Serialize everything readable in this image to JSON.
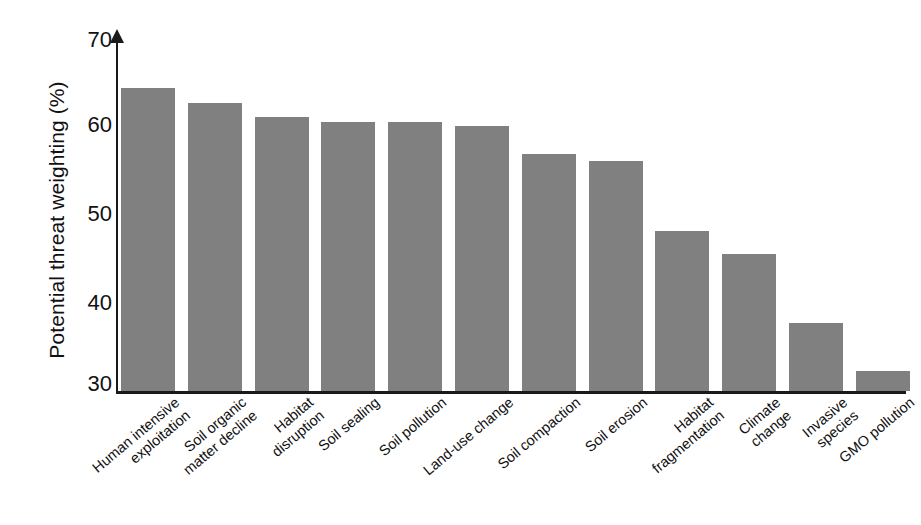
{
  "chart_data": {
    "type": "bar",
    "title": "",
    "xlabel": "",
    "ylabel": "Potential threat weighting (%)",
    "ylim": [
      30,
      70
    ],
    "yticks": [
      30,
      40,
      50,
      60,
      70
    ],
    "grid": false,
    "legend": null,
    "bar_color": "#808080",
    "axis_color": "#1a1a1a",
    "categories": [
      "Human intensive\nexploitation",
      "Soil organic\nmatter decline",
      "Habitat\ndisruption",
      "Soil sealing",
      "Soil pollution",
      "Land-use change",
      "Soil compaction",
      "Soil erosion",
      "Habitat\nfragmentation",
      "Climate\nchange",
      "Invasive\nspecies",
      "GMO pollution"
    ],
    "values": [
      64.5,
      62.8,
      61.2,
      60.7,
      60.7,
      60.2,
      57.0,
      56.2,
      48.2,
      45.6,
      37.8,
      32.3
    ]
  },
  "axis": {
    "y_title": "Potential threat weighting (%)",
    "y_tick_labels": [
      "70",
      "60",
      "50",
      "40",
      "30"
    ]
  }
}
